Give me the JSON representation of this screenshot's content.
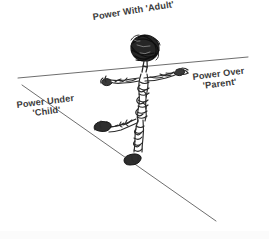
{
  "diagram": {
    "title_semantic": "power-positions-tightrope-walker",
    "background_color": "#ffffff",
    "ink_color": "#2a2a2a",
    "line_color": "#6b6b6b",
    "text_color": "#3b3b3b",
    "labels": {
      "adult": {
        "text": "Power With 'Adult'",
        "name": "power-with-adult-label"
      },
      "parent": {
        "line1": "Power Over",
        "line2": "'Parent'",
        "name": "power-over-parent-label"
      },
      "child": {
        "line1": "Power Under",
        "line2": "'Child'",
        "name": "power-under-child-label"
      }
    },
    "lines": [
      {
        "name": "power-over-line",
        "description": "near-horizontal line rising to the right",
        "x1": 18,
        "y1": 78,
        "x2": 248,
        "y2": 57
      },
      {
        "name": "power-under-line",
        "description": "diagonal line descending to the right",
        "x1": 22,
        "y1": 85,
        "x2": 216,
        "y2": 221
      }
    ],
    "figure": {
      "name": "stick-figure-tightrope-walker",
      "head_center": [
        145,
        48
      ],
      "shoulder": [
        138,
        80
      ],
      "left_hand": [
        103,
        79
      ],
      "right_hand": [
        178,
        71
      ],
      "hip": [
        131,
        120
      ],
      "left_foot": [
        95,
        127
      ],
      "right_foot": [
        133,
        161
      ]
    }
  }
}
